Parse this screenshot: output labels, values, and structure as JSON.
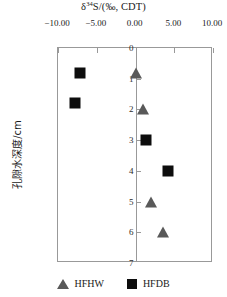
{
  "chart_data": {
    "type": "scatter",
    "title": "δ34S/(‰, CDT)",
    "title_parts": {
      "delta": "δ",
      "mass": "34",
      "element": "S/(",
      "permil": "‰",
      "tail": ", CDT)"
    },
    "xlabel": "δ34S/(‰, CDT)",
    "ylabel": "孔隙水深度/cm",
    "xlim": [
      -10,
      10
    ],
    "ylim": [
      0,
      7
    ],
    "y_inverted": true,
    "x_axis_position": "top",
    "grid": false,
    "legend_position": "bottom",
    "xticks": [
      -10,
      -5,
      0,
      5,
      10
    ],
    "xticklabels": [
      "-10.00",
      "-5.00",
      "0.00",
      "5.00",
      "10.00"
    ],
    "yticks": [
      0,
      1,
      2,
      3,
      4,
      5,
      6,
      7
    ],
    "yticklabels": [
      "0",
      "1",
      "2",
      "3",
      "4",
      "5",
      "6",
      "7"
    ],
    "series": [
      {
        "name": "HFHW",
        "marker": "triangle",
        "color": "#595959",
        "points": [
          {
            "x": 0.0,
            "y": 0.8
          },
          {
            "x": 1.0,
            "y": 2.0
          },
          {
            "x": 2.0,
            "y": 5.0
          },
          {
            "x": 3.5,
            "y": 6.0
          }
        ]
      },
      {
        "name": "HFDB",
        "marker": "square",
        "color": "#0d0d0d",
        "points": [
          {
            "x": -7.2,
            "y": 0.8
          },
          {
            "x": -7.8,
            "y": 1.8
          },
          {
            "x": 1.4,
            "y": 3.0
          },
          {
            "x": 4.2,
            "y": 4.0
          }
        ]
      }
    ]
  },
  "legend": {
    "entries": [
      {
        "label": "HFHW",
        "marker": "triangle"
      },
      {
        "label": "HFDB",
        "marker": "square"
      }
    ]
  }
}
